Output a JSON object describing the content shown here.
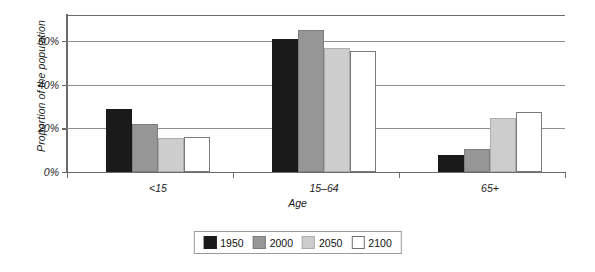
{
  "chart_data": {
    "type": "bar",
    "title": "",
    "xlabel": "Age",
    "ylabel": "Proportion of the population",
    "categories": [
      "<15",
      "15–64",
      "65+"
    ],
    "series": [
      {
        "name": "1950",
        "color": "#1a1a1a",
        "values": [
          29,
          61,
          8
        ]
      },
      {
        "name": "2000",
        "color": "#969696",
        "values": [
          22,
          65,
          10.5
        ]
      },
      {
        "name": "2050",
        "color": "#cdcdcd",
        "values": [
          15.5,
          57,
          25
        ]
      },
      {
        "name": "2100",
        "color": "#ffffff",
        "values": [
          16,
          55.5,
          27.5
        ]
      }
    ],
    "ylim": [
      0,
      72
    ],
    "yticks": [
      0,
      20,
      40,
      60
    ],
    "ytick_labels": [
      "0%",
      "20%",
      "40%",
      "60%"
    ],
    "grid": true,
    "legend_position": "bottom-center"
  }
}
